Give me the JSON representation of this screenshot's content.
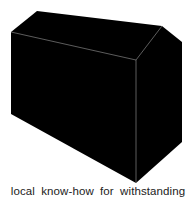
{
  "figure": {
    "shape": "house-box-silhouette",
    "fill_color": "#000000",
    "edge_color": "#9a9a9a"
  },
  "caption": {
    "text": "local know-how for withstanding"
  }
}
